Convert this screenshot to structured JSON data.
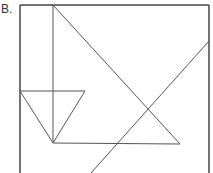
{
  "figure": {
    "label": "B.",
    "stroke_color": "#555555",
    "frame_color": "#444444",
    "background": "#ffffff"
  },
  "geometry": {
    "frame": {
      "left": 20,
      "top": 5,
      "right": 209,
      "bottom_cut": 173
    },
    "lines": [
      {
        "name": "vertical-line",
        "x1": 53,
        "y1": 5,
        "x2": 53,
        "y2": 143
      },
      {
        "name": "large-triangle-hypotenuse",
        "x1": 53,
        "y1": 5,
        "x2": 180,
        "y2": 144
      },
      {
        "name": "large-triangle-base",
        "x1": 53,
        "y1": 143,
        "x2": 180,
        "y2": 144
      },
      {
        "name": "small-triangle-top",
        "x1": 20,
        "y1": 91,
        "x2": 85,
        "y2": 91
      },
      {
        "name": "small-triangle-left",
        "x1": 20,
        "y1": 91,
        "x2": 53,
        "y2": 143
      },
      {
        "name": "small-triangle-right",
        "x1": 85,
        "y1": 91,
        "x2": 53,
        "y2": 143
      },
      {
        "name": "long-diagonal",
        "x1": 209,
        "y1": 41,
        "x2": 91,
        "y2": 173
      }
    ]
  }
}
